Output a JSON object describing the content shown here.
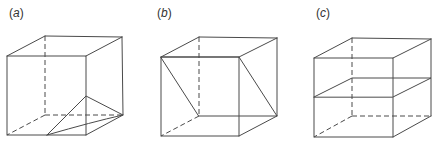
{
  "figure": {
    "panels": [
      {
        "id": "a",
        "label_open": "(",
        "label_letter": "a",
        "label_close": ")",
        "description": "Cube with a triangular-curved hatched region in bottom-right corner"
      },
      {
        "id": "b",
        "label_open": "(",
        "label_letter": "b",
        "label_close": ")",
        "description": "Cube with a diagonal hatched rectangular plane from top-front edge to bottom-back edge"
      },
      {
        "id": "c",
        "label_open": "(",
        "label_letter": "c",
        "label_close": ")",
        "description": "Cube with a horizontal hatched plane cross-section at mid-height"
      }
    ],
    "colors": {
      "line": "#4a4a4a",
      "background": "#ffffff",
      "label": "#333333"
    }
  }
}
